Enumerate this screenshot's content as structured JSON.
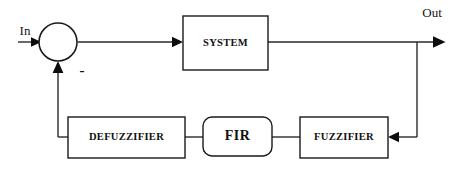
{
  "diagram": {
    "type": "block-diagram",
    "background_color": "#ffffff",
    "line_color": "#2a2a2a",
    "text_color": "#101010",
    "io_labels": {
      "input": "In",
      "output": "Out",
      "summing_negative_sign": "-"
    },
    "blocks": [
      {
        "id": "summing-junction",
        "label": "",
        "shape": "circle"
      },
      {
        "id": "system",
        "label": "SYSTEM",
        "shape": "rectangle"
      },
      {
        "id": "defuzzifier",
        "label": "DEFUZZIFIER",
        "shape": "rectangle"
      },
      {
        "id": "fir",
        "label": "FIR",
        "shape": "rounded-rectangle"
      },
      {
        "id": "fuzzifier",
        "label": "FUZZIFIER",
        "shape": "rectangle"
      }
    ],
    "connections": [
      {
        "from": "In",
        "to": "summing-junction"
      },
      {
        "from": "summing-junction",
        "to": "system"
      },
      {
        "from": "system",
        "to": "Out"
      },
      {
        "from": "Out",
        "to": "fuzzifier"
      },
      {
        "from": "fuzzifier",
        "to": "fir"
      },
      {
        "from": "fir",
        "to": "defuzzifier"
      },
      {
        "from": "defuzzifier",
        "to": "summing-junction"
      }
    ]
  }
}
